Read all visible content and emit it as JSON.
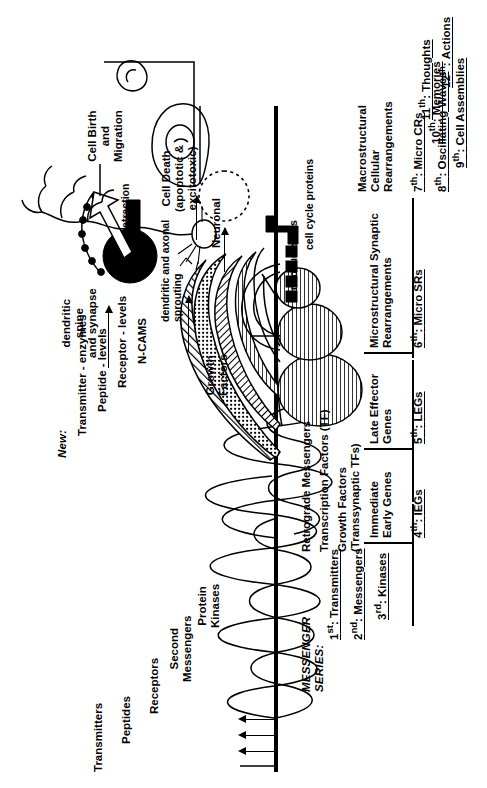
{
  "figure": {
    "title_hint": "Messenger series cascade from transmitters to actions",
    "axis_color": "#000000"
  },
  "left_labels": {
    "items": [
      {
        "text": "Transmitters"
      },
      {
        "text": "Peptides"
      },
      {
        "text": "Receptors"
      },
      {
        "text": "Second\nMessengers"
      },
      {
        "text": "Protein\nKinases"
      }
    ]
  },
  "mid_labels": {
    "items": [
      {
        "text": "Retrograde Messengers"
      },
      {
        "text": "Transcription Factors (TF)"
      },
      {
        "text": "Growth Factors\n(Transsynaptic TFs)"
      }
    ]
  },
  "new_block": {
    "heading": "New:",
    "items": [
      {
        "text": "Transmitter - enzymes"
      },
      {
        "text": "Peptide - levels"
      },
      {
        "text": "Receptor - levels"
      },
      {
        "text": "N-CAMS"
      }
    ]
  },
  "diagram_labels": {
    "growth_factors": "Growth\nFactors",
    "dendritic_spine": "dendritic\nspine\nand synapse",
    "retraction": "retraction",
    "dendritic_axonal_sprouting": "dendritic and axonal\nsprouting",
    "neuronal": "Neuronal",
    "endonucleases": "endonucleases",
    "cell_death": "Cell Death\n(apoptotic &\nexcitotoxic)",
    "cell_cycle_proteins": "cell cycle proteins",
    "cell_birth": "Cell Birth\nand\nMigration",
    "micro_sr": "Microstructural Synaptic\nRearrangements",
    "macro_cr": "Macrostructural\nCellular\nRearrangements"
  },
  "messenger_series": {
    "heading": "MESSENGER\nSERIES:",
    "steps": [
      {
        "ordinal": "1",
        "suffix": "st",
        "label": "Transmitters"
      },
      {
        "ordinal": "2",
        "suffix": "nd",
        "label": "Messengers"
      },
      {
        "ordinal": "3",
        "suffix": "rd",
        "label": "Kinases"
      },
      {
        "ordinal": "4",
        "suffix": "th",
        "label": "IEGs"
      },
      {
        "ordinal": "5",
        "suffix": "th",
        "label": "LEGs"
      },
      {
        "ordinal": "6",
        "suffix": "th",
        "label": "Micro SRs"
      },
      {
        "ordinal": "7",
        "suffix": "th",
        "label": "Micro CRs"
      },
      {
        "ordinal": "8",
        "suffix": "th",
        "label": "Oscillating Waves"
      },
      {
        "ordinal": "9",
        "suffix": "th",
        "label": "Cell Assemblies"
      },
      {
        "ordinal": "10",
        "suffix": "th",
        "label": "Memories"
      },
      {
        "ordinal": "11",
        "suffix": "th",
        "label": "Thoughts"
      },
      {
        "ordinal": "12",
        "suffix": "th",
        "label": "Actions"
      }
    ]
  },
  "gene_groups": {
    "ieg": "Immediate\nEarly Genes",
    "leg": "Late Effector\nGenes"
  }
}
